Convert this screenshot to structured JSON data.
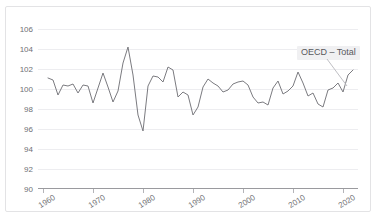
{
  "chart_data": {
    "type": "line",
    "title": "",
    "xlabel": "",
    "ylabel": "",
    "xlim": [
      1959,
      2023
    ],
    "ylim": [
      90,
      107
    ],
    "grid": true,
    "legend_position": "inside-top-right",
    "yticks": [
      90,
      92,
      94,
      96,
      98,
      100,
      102,
      104,
      106
    ],
    "ytick_labels": [
      "90",
      "92",
      "94",
      "96",
      "98",
      "100",
      "102",
      "104",
      "106"
    ],
    "xticks": [
      1960,
      1970,
      1980,
      1990,
      2000,
      2010,
      2020
    ],
    "xtick_labels": [
      "1960",
      "1970",
      "1980",
      "1990",
      "2000",
      "2010",
      "2020"
    ],
    "series": [
      {
        "name": "OECD – Total",
        "color": "#7b7b80",
        "x": [
          1961,
          1962,
          1963,
          1964,
          1965,
          1966,
          1967,
          1968,
          1969,
          1970,
          1971,
          1972,
          1973,
          1974,
          1975,
          1976,
          1977,
          1978,
          1979,
          1980,
          1981,
          1982,
          1983,
          1984,
          1985,
          1986,
          1987,
          1988,
          1989,
          1990,
          1991,
          1992,
          1993,
          1994,
          1995,
          1996,
          1997,
          1998,
          1999,
          2000,
          2001,
          2002,
          2003,
          2004,
          2005,
          2006,
          2007,
          2008,
          2009,
          2010,
          2011,
          2012,
          2013,
          2014,
          2015,
          2016,
          2017,
          2018,
          2019,
          2020,
          2021,
          2022
        ],
        "y": [
          101.1,
          100.9,
          99.4,
          100.4,
          100.3,
          100.5,
          99.6,
          100.4,
          100.3,
          98.6,
          100.1,
          101.6,
          100.2,
          98.7,
          99.8,
          102.6,
          104.2,
          101.4,
          97.4,
          95.8,
          100.3,
          101.3,
          101.2,
          100.7,
          102.2,
          101.9,
          99.2,
          99.7,
          99.4,
          97.4,
          98.2,
          100.2,
          101.0,
          100.6,
          100.3,
          99.7,
          99.9,
          100.5,
          100.7,
          100.8,
          100.4,
          99.2,
          98.6,
          98.7,
          98.4,
          100.1,
          100.8,
          99.5,
          99.8,
          100.3,
          101.7,
          100.6,
          99.3,
          99.6,
          98.5,
          98.2,
          99.9,
          100.1,
          100.6,
          99.7,
          101.4,
          101.9
        ],
        "y_extra_note": "second half continues to 2022",
        "annotated_extremes": {
          "peak_1973": 104.2,
          "trough_1975": 95.8,
          "trough_2009": 94.9,
          "trough_2020": 91.4,
          "final_2022": 100.7
        }
      }
    ],
    "legend_text": "OECD – Total"
  },
  "legend": {
    "label": "OECD – Total"
  },
  "title_strip": {
    "text": ""
  }
}
